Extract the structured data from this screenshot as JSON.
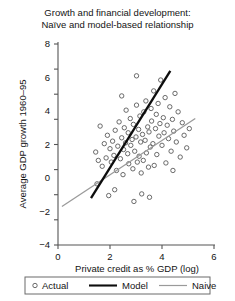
{
  "chart_data": {
    "type": "scatter",
    "title_line1": "Growth and financial development:",
    "title_line2": "Naïve and model-based relationship",
    "xlabel": "Private credit as % GDP (log)",
    "ylabel": "Average GDP growth 1960–95",
    "xlim": [
      0,
      6
    ],
    "ylim": [
      -4,
      8
    ],
    "xticks": [
      0,
      2,
      4,
      6
    ],
    "yticks": [
      -4,
      -2,
      0,
      2,
      4,
      6,
      8
    ],
    "xticklabels": [
      "0",
      "2",
      "4",
      "6"
    ],
    "yticklabels": [
      "-4",
      "-2",
      "0",
      "2",
      "4",
      "6",
      "8"
    ],
    "grid": false,
    "legend_position": "below-axes",
    "colors": {
      "marker_stroke": "#5a5a5a",
      "model_line": "#0d0d0d",
      "naive_line": "#9a9a9a",
      "axis": "#555555",
      "text": "#141414"
    },
    "series": [
      {
        "name": "Actual",
        "type": "scatter",
        "marker": "open-circle",
        "points": [
          [
            1.45,
            1.55
          ],
          [
            1.5,
            -0.35
          ],
          [
            1.62,
            3.1
          ],
          [
            1.7,
            0.7
          ],
          [
            1.78,
            2.05
          ],
          [
            1.85,
            1.2
          ],
          [
            1.9,
            2.55
          ],
          [
            1.95,
            -1.05
          ],
          [
            2.0,
            1.75
          ],
          [
            2.05,
            0.95
          ],
          [
            2.1,
            2.2
          ],
          [
            2.15,
            1.35
          ],
          [
            2.2,
            2.85
          ],
          [
            2.25,
            0.45
          ],
          [
            2.3,
            1.9
          ],
          [
            2.35,
            3.35
          ],
          [
            2.4,
            1.15
          ],
          [
            2.45,
            2.4
          ],
          [
            2.5,
            0.2
          ],
          [
            2.52,
            1.7
          ],
          [
            2.55,
            3.0
          ],
          [
            2.6,
            2.1
          ],
          [
            2.62,
            4.05
          ],
          [
            2.68,
            1.45
          ],
          [
            2.7,
            2.7
          ],
          [
            2.72,
            0.85
          ],
          [
            2.78,
            3.55
          ],
          [
            2.8,
            1.95
          ],
          [
            2.85,
            2.3
          ],
          [
            2.88,
            0.55
          ],
          [
            2.9,
            3.2
          ],
          [
            2.95,
            1.6
          ],
          [
            3.0,
            2.45
          ],
          [
            3.02,
            4.35
          ],
          [
            3.05,
            0.95
          ],
          [
            3.1,
            2.9
          ],
          [
            3.12,
            1.3
          ],
          [
            3.15,
            3.7
          ],
          [
            3.18,
            2.15
          ],
          [
            3.2,
            0.3
          ],
          [
            3.25,
            2.6
          ],
          [
            3.28,
            1.05
          ],
          [
            3.3,
            3.95
          ],
          [
            3.35,
            2.25
          ],
          [
            3.38,
            4.6
          ],
          [
            3.4,
            1.5
          ],
          [
            3.45,
            3.05
          ],
          [
            3.48,
            0.65
          ],
          [
            3.5,
            2.75
          ],
          [
            3.55,
            1.85
          ],
          [
            3.58,
            4.15
          ],
          [
            3.6,
            3.4
          ],
          [
            3.65,
            2.05
          ],
          [
            3.68,
            5.2
          ],
          [
            3.7,
            0.75
          ],
          [
            3.75,
            2.95
          ],
          [
            3.78,
            3.8
          ],
          [
            3.8,
            1.4
          ],
          [
            3.85,
            4.45
          ],
          [
            3.88,
            2.5
          ],
          [
            3.92,
            3.25
          ],
          [
            3.95,
            5.85
          ],
          [
            4.0,
            1.95
          ],
          [
            4.05,
            3.6
          ],
          [
            4.08,
            2.7
          ],
          [
            4.12,
            4.8
          ],
          [
            4.15,
            0.9
          ],
          [
            4.2,
            3.15
          ],
          [
            4.25,
            2.35
          ],
          [
            4.3,
            4.25
          ],
          [
            4.35,
            1.6
          ],
          [
            4.4,
            3.5
          ],
          [
            4.45,
            2.8
          ],
          [
            4.5,
            5.05
          ],
          [
            4.55,
            2.15
          ],
          [
            4.62,
            3.95
          ],
          [
            4.7,
            1.25
          ],
          [
            4.78,
            3.3
          ],
          [
            4.85,
            2.55
          ],
          [
            4.95,
            1.8
          ],
          [
            5.05,
            2.95
          ],
          [
            1.55,
            1.05
          ],
          [
            2.18,
            -0.7
          ],
          [
            2.92,
            -1.4
          ],
          [
            3.22,
            -0.95
          ],
          [
            3.52,
            -1.15
          ],
          [
            2.45,
            4.9
          ],
          [
            3.02,
            6.1
          ],
          [
            4.42,
            0.45
          ]
        ]
      },
      {
        "name": "Model",
        "type": "line",
        "style": "solid-thick",
        "endpoints": [
          [
            1.27,
            -1.2
          ],
          [
            4.32,
            6.4
          ]
        ]
      },
      {
        "name": "Naive",
        "type": "line",
        "style": "solid-thin",
        "endpoints": [
          [
            0.15,
            -1.7
          ],
          [
            5.28,
            3.55
          ]
        ]
      }
    ]
  },
  "legend": {
    "items": [
      {
        "label": "Actual",
        "glyph": "open-circle-marker"
      },
      {
        "label": "Model",
        "glyph": "thick-black-line"
      },
      {
        "label": "Naive",
        "glyph": "thin-gray-line"
      }
    ]
  }
}
